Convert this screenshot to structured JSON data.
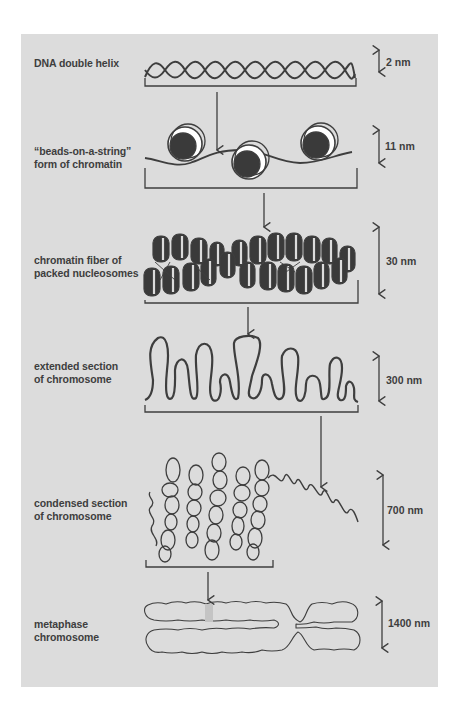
{
  "figure": {
    "background": "#dcdcdc",
    "ink": "#3e3e3e",
    "levels": [
      {
        "id": "dna",
        "label": "DNA double helix",
        "scale": "2 nm"
      },
      {
        "id": "beads",
        "label": "“beads-on-a-string”\nform of chromatin",
        "scale": "11 nm"
      },
      {
        "id": "fiber",
        "label": "chromatin fiber of\npacked nucleosomes",
        "scale": "30 nm"
      },
      {
        "id": "extended",
        "label": "extended section\nof chromosome",
        "scale": "300 nm"
      },
      {
        "id": "condensed",
        "label": "condensed section\nof chromosome",
        "scale": "700 nm"
      },
      {
        "id": "metaphase",
        "label": "metaphase\nchromosome",
        "scale": "1400 nm"
      }
    ]
  }
}
